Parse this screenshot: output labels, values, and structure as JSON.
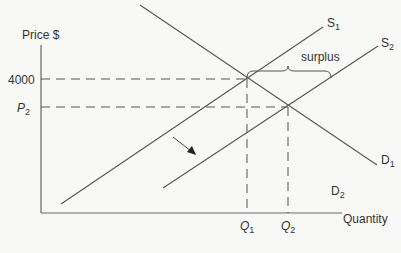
{
  "diagram": {
    "type": "supply-demand",
    "y_axis_label": "Price $",
    "x_axis_label": "Quantity",
    "price_levels": [
      {
        "label": "4000",
        "y": 79
      },
      {
        "label_main": "P",
        "label_sub": "2",
        "y": 107
      }
    ],
    "quantity_levels": [
      {
        "label_main": "Q",
        "label_sub": "1",
        "x": 247
      },
      {
        "label_main": "Q",
        "label_sub": "2",
        "x": 288
      }
    ],
    "curves": [
      {
        "name": "S1",
        "label_main": "S",
        "label_sub": "1"
      },
      {
        "name": "S2",
        "label_main": "S",
        "label_sub": "2"
      },
      {
        "name": "D1",
        "label_main": "D",
        "label_sub": "1"
      },
      {
        "name": "D2",
        "label_main": "D",
        "label_sub": "2"
      }
    ],
    "annotation": "surplus",
    "colors": {
      "line": "#555555",
      "background": "#f8f8f7",
      "text": "#333333"
    }
  }
}
